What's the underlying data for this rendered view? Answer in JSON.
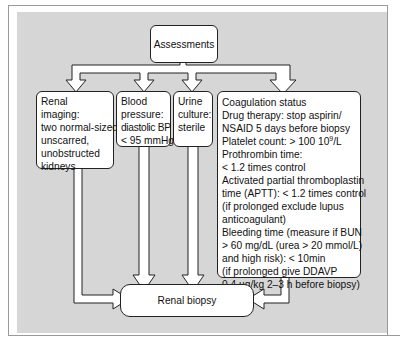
{
  "diagram": {
    "top_node": {
      "label": "Assessments"
    },
    "assessments": [
      {
        "id": "renal-imaging",
        "lines": [
          "Renal",
          "imaging:",
          "two normal-sized,",
          "unscarred,",
          "unobstructed",
          "kidneys"
        ]
      },
      {
        "id": "blood-pressure",
        "lines": [
          "Blood",
          "pressure:",
          "diastolic BP",
          "< 95 mmHg"
        ]
      },
      {
        "id": "urine-culture",
        "lines": [
          "Urine",
          "culture:",
          "sterile"
        ]
      },
      {
        "id": "coagulation-status",
        "lines": [
          "Coagulation status",
          "Drug  therapy: stop aspirin/",
          "NSAID 5 days before biopsy",
          "Platelet count: > 100  10",
          "Prothrombin time:",
          "< 1.2 times control",
          "Activated partial thromboplastin",
          "time (APTT): < 1.2 times control",
          "(if prolonged exclude lupus",
          "anticoagulant)",
          "Bleeding time (measure if BUN",
          "> 60 mg/dL (urea > 20 mmol/L)",
          "and high risk): < 10min",
          "(if prolonged give DDAVP",
          "0.4 µg/kg 2–3 h before biopsy)"
        ],
        "platelet_exponent": "9",
        "platelet_unit": "/L"
      }
    ],
    "bottom_node": {
      "label": "Renal biopsy"
    },
    "colors": {
      "panel": "#d6d6d6",
      "box_fill": "#ffffff",
      "stroke": "#222222",
      "frame": "#9a9a9a"
    }
  }
}
